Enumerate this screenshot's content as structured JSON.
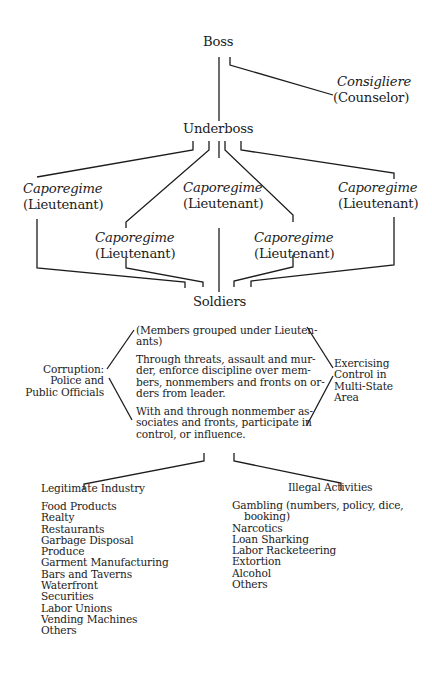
{
  "boss": {
    "label": "Boss"
  },
  "consigliere": {
    "title": "Consigliere",
    "subtitle": "(Counselor)"
  },
  "underboss": {
    "label": "Underboss"
  },
  "caporegimes": [
    {
      "title": "Caporegime",
      "subtitle": "(Lieutenant)"
    },
    {
      "title": "Caporegime",
      "subtitle": "(Lieutenant)"
    },
    {
      "title": "Caporegime",
      "subtitle": "(Lieutenant)"
    },
    {
      "title": "Caporegime",
      "subtitle": "(Lieutenant)"
    },
    {
      "title": "Caporegime",
      "subtitle": "(Lieutenant)"
    }
  ],
  "soldiers": {
    "label": "Soldiers"
  },
  "soldier_description": {
    "paragraphs": [
      [
        "(Members grouped under Lieuten-",
        "ants)"
      ],
      [
        "Through threats, assault and mur-",
        "der, enforce discipline over mem-",
        "bers, nonmembers and fronts on or-",
        "ders from leader."
      ],
      [
        "With and through nonmember as-",
        "sociates and fronts, participate in",
        "control, or influence."
      ]
    ]
  },
  "corruption": {
    "lines": [
      "Corruption:",
      "Police and",
      "Public Officials"
    ]
  },
  "control": {
    "lines": [
      "Exercising",
      "Control in",
      "Multi-State",
      "Area"
    ]
  },
  "legitimate_industry": {
    "heading": "Legitimate Industry",
    "items": [
      "Food Products",
      "Realty",
      "Restaurants",
      "Garbage Disposal",
      "Produce",
      "Garment Manufacturing",
      "Bars and Taverns",
      "Waterfront",
      "Securities",
      "Labor Unions",
      "Vending Machines",
      "Others"
    ]
  },
  "illegal_activities": {
    "heading": "Illegal Activities",
    "items": [
      "Gambling (numbers, policy, dice,",
      "booking)",
      "Narcotics",
      "Loan Sharking",
      "Labor Racketeering",
      "Extortion",
      "Alcohol",
      "Others"
    ]
  }
}
